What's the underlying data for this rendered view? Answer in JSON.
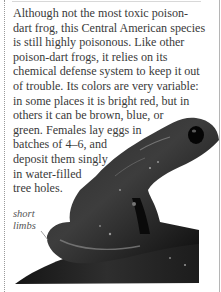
{
  "article": {
    "body_lines": [
      "Although not the most toxic poison-",
      "dart frog, this Central American species",
      "is still highly poisonous. Like other",
      "poison-dart frogs, it relies on its",
      "chemical defense system to keep it out",
      "of trouble. Its colors are very variable:",
      "in some places it is bright red, but in",
      "others it can be brown, blue, or",
      "green. Females lay eggs in",
      "batches of 4–6, and",
      "deposit them singly",
      "in water-filled",
      "tree holes."
    ],
    "annotation": {
      "lines": [
        "short",
        "limbs"
      ]
    },
    "image": {
      "subject": "poison-dart-frog",
      "tone": "black-and-white"
    }
  },
  "colors": {
    "text": "#3a3a3a",
    "caption": "#555555",
    "frog_dark": "#0c0c0c",
    "frog_mid": "#3c3c3c",
    "frog_highlight": "#9a9a9a",
    "rules": "#b5b5b5"
  }
}
